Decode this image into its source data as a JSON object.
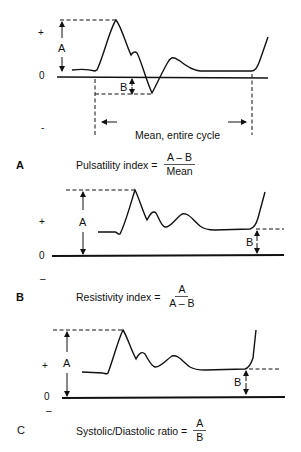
{
  "panels": [
    {
      "letter": "A",
      "axis": {
        "plus": "+",
        "zero": "0",
        "minus": "-"
      },
      "dimension_labels": {
        "a": "A",
        "b": "B"
      },
      "mean_label": "Mean, entire cycle",
      "formula": {
        "name": "Pulsatility index =",
        "numerator": "A – B",
        "denominator": "Mean"
      }
    },
    {
      "letter": "B",
      "axis": {
        "plus": "+",
        "zero": "0",
        "minus": "–"
      },
      "dimension_labels": {
        "a": "A",
        "b": "B"
      },
      "formula": {
        "name": "Resistivity index =",
        "numerator": "A",
        "denominator": "A – B"
      }
    },
    {
      "letter": "C",
      "axis": {
        "plus": "+",
        "zero": "0",
        "minus": "–"
      },
      "dimension_labels": {
        "a": "A",
        "b": "B"
      },
      "formula": {
        "name": "Systolic/Diastolic ratio =",
        "numerator": "A",
        "denominator": "B"
      }
    }
  ],
  "colors": {
    "line": "#111111",
    "background": "#ffffff"
  }
}
